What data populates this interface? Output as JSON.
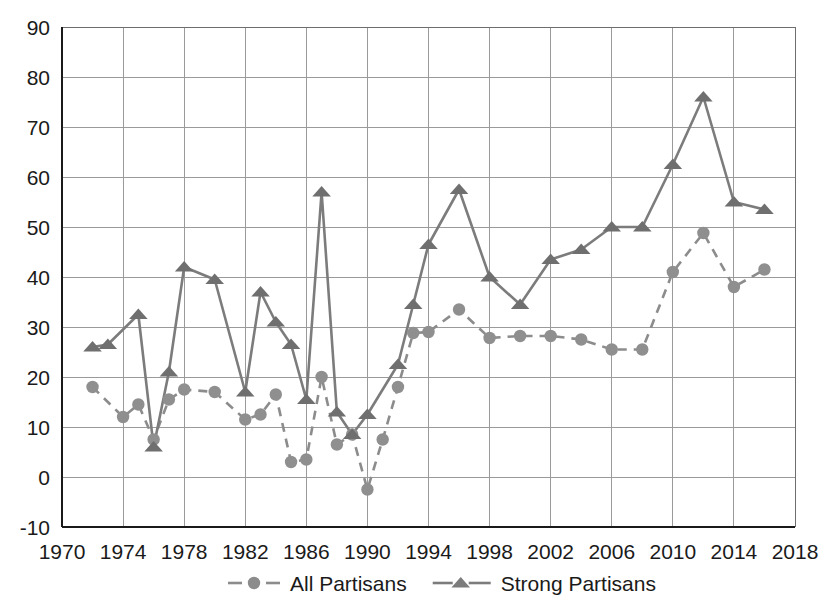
{
  "chart_data": {
    "type": "line",
    "title": "",
    "subtitle": "",
    "xlabel": "",
    "ylabel": "",
    "xlim": [
      1970,
      2018
    ],
    "ylim": [
      -10,
      90
    ],
    "grid": true,
    "legend_position": "bottom",
    "x_ticks": [
      1970,
      1974,
      1978,
      1982,
      1986,
      1990,
      1994,
      1998,
      2002,
      2006,
      2010,
      2014,
      2018
    ],
    "y_ticks": [
      -10,
      0,
      10,
      20,
      30,
      40,
      50,
      60,
      70,
      80,
      90
    ],
    "series": [
      {
        "name": "All Partisans",
        "marker": "circle",
        "line_style": "dashed",
        "color": "#8c8c8c",
        "x": [
          1972,
          1974,
          1975,
          1976,
          1977,
          1978,
          1980,
          1982,
          1983,
          1984,
          1985,
          1986,
          1987,
          1988,
          1989,
          1990,
          1991,
          1992,
          1993,
          1994,
          1996,
          1998,
          2000,
          2002,
          2004,
          2006,
          2008,
          2010,
          2012,
          2014,
          2016
        ],
        "y": [
          18.0,
          12.0,
          14.5,
          7.5,
          15.5,
          17.5,
          17.0,
          11.5,
          12.5,
          16.5,
          3.0,
          3.5,
          20.0,
          6.5,
          8.5,
          -2.5,
          7.5,
          18.0,
          28.8,
          29.0,
          33.5,
          27.8,
          28.2,
          28.2,
          27.5,
          25.5,
          25.5,
          41.0,
          48.8,
          38.0,
          41.5
        ]
      },
      {
        "name": "Strong Partisans",
        "marker": "triangle",
        "line_style": "solid",
        "color": "#7c7c7c",
        "x": [
          1972,
          1973,
          1975,
          1976,
          1977,
          1978,
          1980,
          1982,
          1983,
          1984,
          1985,
          1986,
          1987,
          1988,
          1989,
          1990,
          1992,
          1993,
          1994,
          1996,
          1998,
          2000,
          2002,
          2004,
          2006,
          2008,
          2010,
          2012,
          2014,
          2016
        ],
        "y": [
          26.0,
          26.5,
          32.5,
          6.0,
          21.0,
          42.0,
          39.5,
          17.0,
          37.0,
          31.0,
          26.5,
          15.5,
          57.0,
          13.0,
          8.5,
          12.5,
          22.5,
          34.5,
          46.5,
          57.5,
          40.0,
          34.5,
          43.5,
          45.5,
          50.0,
          50.0,
          62.5,
          76.0,
          55.0,
          53.5
        ]
      }
    ]
  },
  "legend": {
    "items": [
      {
        "label": "All Partisans",
        "marker": "circle",
        "style": "dashed"
      },
      {
        "label": "Strong Partisans",
        "marker": "triangle",
        "style": "solid"
      }
    ]
  },
  "colors": {
    "all_partisans": "#8c8c8c",
    "strong_partisans": "#7c7c7c",
    "grid": "#9a9a9a",
    "axis": "#1a1a1a",
    "background": "#ffffff"
  }
}
